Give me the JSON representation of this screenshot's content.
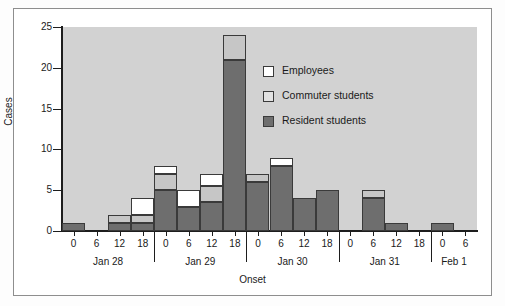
{
  "chart_data": {
    "type": "bar",
    "title": "",
    "xlabel": "Onset",
    "ylabel": "Cases",
    "ylim": [
      0,
      25
    ],
    "yticks": [
      0,
      5,
      10,
      15,
      20,
      25
    ],
    "grid": false,
    "stacked": true,
    "legend_position": "inside-upper-right",
    "legend": [
      {
        "name": "Employees",
        "color": "#ffffff"
      },
      {
        "name": "Commuter students",
        "color": "#e2e2e2"
      },
      {
        "name": "Resident students",
        "color": "#6e6e6e"
      }
    ],
    "days": [
      {
        "name": "Jan 28",
        "hours": [
          "0",
          "6",
          "12",
          "18"
        ]
      },
      {
        "name": "Jan 29",
        "hours": [
          "0",
          "6",
          "12",
          "18"
        ]
      },
      {
        "name": "Jan 30",
        "hours": [
          "0",
          "6",
          "12",
          "18"
        ]
      },
      {
        "name": "Jan 31",
        "hours": [
          "0",
          "6",
          "12",
          "18"
        ]
      },
      {
        "name": "Feb 1",
        "hours": [
          "0",
          "6"
        ]
      }
    ],
    "categories": [
      "Jan 28 0",
      "Jan 28 6",
      "Jan 28 12",
      "Jan 28 18",
      "Jan 29 0",
      "Jan 29 6",
      "Jan 29 12",
      "Jan 29 18",
      "Jan 30 0",
      "Jan 30 6",
      "Jan 30 12",
      "Jan 30 18",
      "Jan 31 0",
      "Jan 31 6",
      "Jan 31 12",
      "Jan 31 18",
      "Feb 1 0",
      "Feb 1 6"
    ],
    "series": [
      {
        "name": "Resident students",
        "color": "#6e6e6e",
        "values": [
          1,
          0,
          1,
          1,
          5,
          3,
          3.5,
          21,
          6,
          8,
          4,
          5,
          0,
          4,
          1,
          0,
          1,
          0
        ]
      },
      {
        "name": "Commuter students",
        "color": "#c6c6c6",
        "values": [
          0,
          0,
          1,
          1,
          2,
          0,
          2,
          3,
          1,
          0,
          0,
          0,
          0,
          1,
          0,
          0,
          0,
          0
        ]
      },
      {
        "name": "Employees",
        "color": "#ffffff",
        "values": [
          0,
          0,
          0,
          2,
          1,
          2,
          1.5,
          0,
          0,
          1,
          0,
          0,
          0,
          0,
          0,
          0,
          0,
          0
        ]
      }
    ],
    "totals": [
      1,
      0,
      2,
      4,
      8,
      5,
      7,
      24,
      7,
      9,
      4,
      5,
      0,
      5,
      1,
      0,
      1,
      0
    ]
  }
}
